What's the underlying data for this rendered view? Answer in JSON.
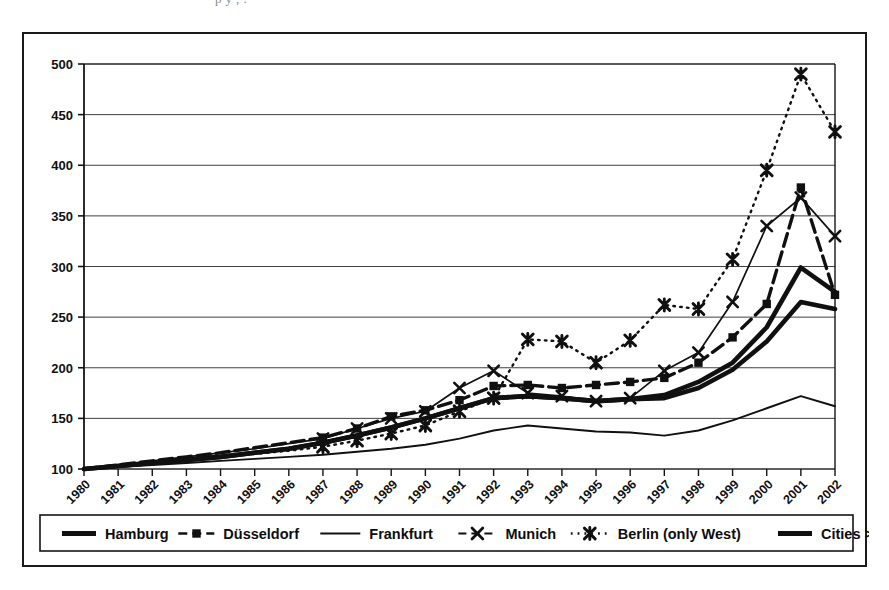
{
  "page": {
    "top_clipped_text": "p y , ."
  },
  "chart_data": {
    "type": "line",
    "title": "",
    "subtitle": "",
    "xlabel": "",
    "ylabel": "",
    "grid": true,
    "legend_position": "bottom",
    "ylim": [
      100,
      500
    ],
    "yticks": [
      100,
      150,
      200,
      250,
      300,
      350,
      400,
      450,
      500
    ],
    "ytick_labels": [
      "100",
      "150",
      "200",
      "250",
      "300",
      "350",
      "400",
      "450",
      "500"
    ],
    "categories": [
      "1980",
      "1981",
      "1982",
      "1983",
      "1984",
      "1985",
      "1986",
      "1987",
      "1988",
      "1989",
      "1990",
      "1991",
      "1992",
      "1993",
      "1994",
      "1995",
      "1996",
      "1997",
      "1998",
      "1999",
      "2000",
      "2001",
      "2002"
    ],
    "series": [
      {
        "name": "Hamburg",
        "style": "thick-solid",
        "marker": "none",
        "color": "#101010",
        "values": [
          100,
          103,
          106,
          109,
          112,
          116,
          120,
          126,
          133,
          141,
          150,
          160,
          170,
          172,
          170,
          167,
          169,
          170,
          180,
          198,
          226,
          265,
          258
        ]
      },
      {
        "name": "Düsseldorf",
        "style": "dashed",
        "marker": "square",
        "color": "#101010",
        "values": [
          100,
          104,
          108,
          112,
          116,
          121,
          126,
          131,
          140,
          152,
          158,
          168,
          182,
          183,
          180,
          183,
          186,
          190,
          205,
          230,
          263,
          378,
          272
        ]
      },
      {
        "name": "Frankfurt",
        "style": "thin-solid",
        "marker": "none",
        "color": "#101010",
        "values": [
          100,
          102,
          104,
          106,
          108,
          110,
          112,
          114,
          117,
          120,
          124,
          130,
          138,
          143,
          140,
          137,
          136,
          133,
          138,
          148,
          160,
          172,
          162
        ]
      },
      {
        "name": "Munich",
        "style": "thin-solid-marker",
        "marker": "x",
        "color": "#101010",
        "values": [
          100,
          104,
          108,
          112,
          116,
          120,
          125,
          130,
          140,
          150,
          157,
          180,
          197,
          175,
          172,
          167,
          170,
          197,
          215,
          265,
          340,
          368,
          330
        ]
      },
      {
        "name": "Berlin (only West)",
        "style": "dotted",
        "marker": "star",
        "color": "#101010",
        "values": [
          100,
          103,
          106,
          109,
          112,
          115,
          118,
          122,
          128,
          135,
          143,
          157,
          170,
          228,
          226,
          205,
          227,
          262,
          258,
          307,
          395,
          490,
          433
        ]
      },
      {
        "name": "Cities >500,000",
        "style": "thick-solid",
        "marker": "none",
        "color": "#101010",
        "values": [
          100,
          103,
          106,
          109,
          112,
          116,
          120,
          126,
          133,
          141,
          150,
          160,
          170,
          172,
          170,
          167,
          169,
          173,
          186,
          205,
          240,
          299,
          275
        ]
      }
    ]
  },
  "legend": {
    "items": [
      {
        "label": "Hamburg",
        "swatch": "thick-line-swatch"
      },
      {
        "label": "Düsseldorf",
        "swatch": "dashed-square-swatch"
      },
      {
        "label": "Frankfurt",
        "swatch": "thin-line-swatch"
      },
      {
        "label": "Munich",
        "swatch": "x-marker-swatch"
      },
      {
        "label": "Berlin (only West)",
        "swatch": "dotted-star-swatch"
      },
      {
        "label": "Cities >500,000",
        "swatch": "thick-line-swatch"
      }
    ]
  }
}
